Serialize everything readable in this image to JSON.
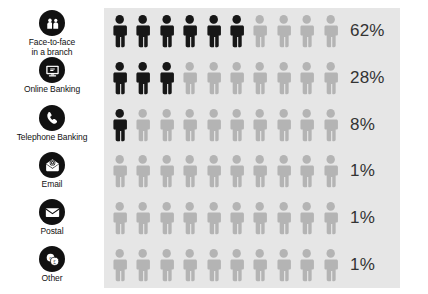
{
  "chart_data": {
    "type": "bar",
    "subtype": "pictogram",
    "title": "",
    "xlabel": "",
    "ylabel": "",
    "categories": [
      "Face-to-face\nin a branch",
      "Online Banking",
      "Telephone Banking",
      "Email",
      "Postal",
      "Other"
    ],
    "values": [
      62,
      28,
      8,
      1,
      1,
      1
    ],
    "value_labels": [
      "62%",
      "28%",
      "8%",
      "1%",
      "1%",
      "1%"
    ],
    "unit": "%",
    "xlim": [
      0,
      100
    ],
    "grid": false,
    "legend": "none",
    "icons_per_row": 10,
    "percent_per_icon": 10
  },
  "legend": {
    "items": [
      {
        "label": "Face-to-face\nin a branch",
        "icon": "two-people-icon"
      },
      {
        "label": "Online Banking",
        "icon": "monitor-icon"
      },
      {
        "label": "Telephone Banking",
        "icon": "telephone-handset-icon"
      },
      {
        "label": "Email",
        "icon": "envelope-at-icon"
      },
      {
        "label": "Postal",
        "icon": "envelope-icon"
      },
      {
        "label": "Other",
        "icon": "coins-currency-icon"
      }
    ]
  },
  "colors": {
    "panel_background": "#e6e6e6",
    "figure_filled": "#171717",
    "figure_empty": "#b4b4b4",
    "percent_text": "#333333",
    "icon_background": "#111111",
    "icon_glyph": "#ffffff",
    "page_background": "#ffffff"
  }
}
